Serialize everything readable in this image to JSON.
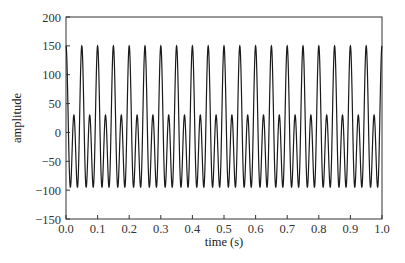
{
  "chart_data": {
    "type": "line",
    "title": "",
    "xlabel": "time (s)",
    "ylabel": "amplitude",
    "xlim": [
      0.0,
      1.0
    ],
    "ylim": [
      -150,
      200
    ],
    "xticks": [
      "0.0",
      "0.1",
      "0.2",
      "0.3",
      "0.4",
      "0.5",
      "0.6",
      "0.7",
      "0.8",
      "0.9",
      "1.0"
    ],
    "yticks": [
      "200",
      "150",
      "100",
      "50",
      "0",
      "−50",
      "−100",
      "−150"
    ],
    "grid": false,
    "legend": null,
    "series": [
      {
        "name": "signal",
        "description": "Periodic signal, fundamental 20 Hz: 60*cos(2*pi*20*t) + 90*cos(2*pi*40*t)",
        "fundamental_hz": 20,
        "components": [
          {
            "freq_hz": 20,
            "amplitude": 60
          },
          {
            "freq_hz": 40,
            "amplitude": 90
          }
        ],
        "major_peak_value": 150,
        "minor_peak_value": 30,
        "trough_value": -95,
        "major_peak_times": [
          0.0,
          0.05,
          0.1,
          0.15,
          0.2,
          0.25,
          0.3,
          0.35,
          0.4,
          0.45,
          0.5,
          0.55,
          0.6,
          0.65,
          0.7,
          0.75,
          0.8,
          0.85,
          0.9,
          0.95,
          1.0
        ],
        "color": "#1a1a1a"
      }
    ]
  },
  "style": {
    "line_color": "#1a1a1a",
    "axis_color": "#333333"
  }
}
